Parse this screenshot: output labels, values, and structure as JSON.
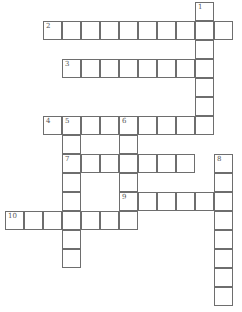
{
  "crossword": {
    "origin_x": 43,
    "origin_y": 2,
    "cell_size": 19,
    "border_color": "#6e6e6e",
    "words": [
      {
        "number": "1",
        "direction": "down",
        "row": 0,
        "col": 8,
        "length": 7
      },
      {
        "number": "2",
        "direction": "across",
        "row": 1,
        "col": 0,
        "length": 10
      },
      {
        "number": "3",
        "direction": "across",
        "row": 3,
        "col": 1,
        "length": 8
      },
      {
        "number": "4",
        "direction": "across",
        "row": 6,
        "col": 0,
        "length": 9
      },
      {
        "number": "5",
        "direction": "down",
        "row": 6,
        "col": 1,
        "length": 8
      },
      {
        "number": "6",
        "direction": "down",
        "row": 6,
        "col": 4,
        "length": 6
      },
      {
        "number": "7",
        "direction": "across",
        "row": 8,
        "col": 1,
        "length": 7
      },
      {
        "number": "8",
        "direction": "down",
        "row": 8,
        "col": 9,
        "length": 8
      },
      {
        "number": "9",
        "direction": "across",
        "row": 10,
        "col": 4,
        "length": 6
      },
      {
        "number": "10",
        "direction": "across",
        "row": 11,
        "col": -2,
        "length": 6
      }
    ]
  }
}
